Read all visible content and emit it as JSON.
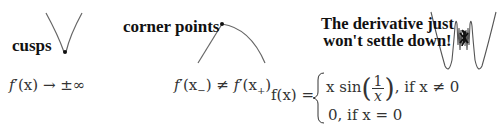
{
  "panels": {
    "cusps": {
      "label": "cusps",
      "condition": {
        "f": "f",
        "prime": "′",
        "arg": "(x)",
        "arrow": " → ",
        "limit": "±∞"
      }
    },
    "corner": {
      "label": "corner points",
      "condition": {
        "lhs_f": "f",
        "prime": "′",
        "lhs_open": "(x",
        "lhs_sub": "−",
        "close": ")",
        "neq": " ≠ ",
        "rhs_f": "f",
        "rhs_open": "(x",
        "rhs_sub": "+"
      }
    },
    "oscillation": {
      "label_line1": "The derivative just",
      "label_line2": "won't settle down!",
      "function": {
        "lhs": "f(x) =",
        "case1_prefix": "x sin",
        "case1_num": "1",
        "case1_den": "x",
        "case1_suffix": ", if x ≠ 0",
        "case2": "0, if x = 0"
      }
    }
  },
  "colors": {
    "curve": "#555555",
    "dot": "#111111",
    "text": "#222222"
  }
}
